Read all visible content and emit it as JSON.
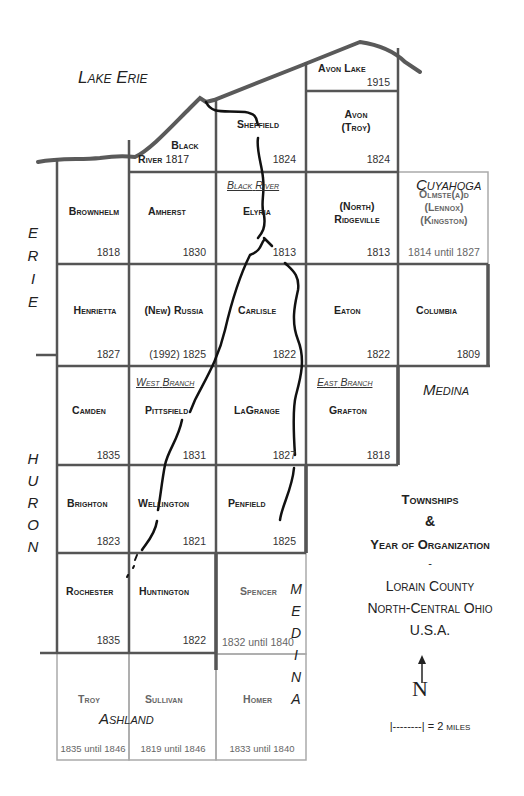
{
  "bodies_of_water": {
    "lake": "Lake Erie"
  },
  "neighbor_counties": {
    "erie": [
      "E",
      "R",
      "I",
      "E"
    ],
    "huron": [
      "H",
      "U",
      "R",
      "O",
      "N"
    ],
    "medina_vertical": [
      "M",
      "E",
      "D",
      "I",
      "N",
      "A"
    ],
    "cuyahoga": "Cuyahoga",
    "medina": "Medina",
    "ashland": "Ashland"
  },
  "rivers": {
    "black_river": [
      "Black",
      "River"
    ],
    "west_branch": [
      "West",
      "Branch"
    ],
    "east_branch": [
      "East",
      "Branch"
    ]
  },
  "townships": [
    {
      "name": "Avon Lake",
      "year": "1915"
    },
    {
      "name": "Black",
      "name2": "River",
      "year": "1817"
    },
    {
      "name": "Sheffield",
      "year": "1824"
    },
    {
      "name": "Avon",
      "name2": "(Troy)",
      "year": "1824"
    },
    {
      "name": "Brownhelm",
      "year": "1818"
    },
    {
      "name": "Amherst",
      "year": "1830"
    },
    {
      "name": "Elyria",
      "year": "1813"
    },
    {
      "name": "(North)",
      "name2": "Ridgeville",
      "year": "1813"
    },
    {
      "name": "Olmste(a)d",
      "name2": "(Lennox)",
      "name3": "(Kingston)",
      "year": "1814 until 1827"
    },
    {
      "name": "Henrietta",
      "year": "1827"
    },
    {
      "name": "(New) Russia",
      "year": "(1992) 1825"
    },
    {
      "name": "Carlisle",
      "year": "1822"
    },
    {
      "name": "Eaton",
      "year": "1822"
    },
    {
      "name": "Columbia",
      "year": "1809"
    },
    {
      "name": "Camden",
      "year": "1835"
    },
    {
      "name": "Pittsfield",
      "year": "1831"
    },
    {
      "name": "LaGrange",
      "year": "1827"
    },
    {
      "name": "Grafton",
      "year": "1818"
    },
    {
      "name": "Brighton",
      "year": "1823"
    },
    {
      "name": "Wellington",
      "year": "1821"
    },
    {
      "name": "Penfield",
      "year": "1825"
    },
    {
      "name": "Rochester",
      "year": "1835"
    },
    {
      "name": "Huntington",
      "year": "1822"
    },
    {
      "name": "Spencer",
      "year": "1832 until 1840"
    },
    {
      "name": "Troy",
      "year": "1835 until 1846"
    },
    {
      "name": "Sullivan",
      "year": "1819 until 1846"
    },
    {
      "name": "Homer",
      "year": "1833 until 1840"
    }
  ],
  "legend": {
    "title1": "Townships",
    "amp": "&",
    "title2": "Year of Organization",
    "dash": "-",
    "county": "Lorain County",
    "region": "North-Central Ohio",
    "country": "U.S.A.",
    "north": "N",
    "scale": "|--------| = 2 miles"
  },
  "colors": {
    "border": "#555555",
    "light_border": "#aaaaaa",
    "river": "#111111",
    "shore": "#555555"
  }
}
